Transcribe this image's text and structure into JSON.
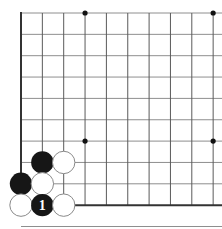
{
  "figure": {
    "kind": "go-board-diagram",
    "background_color": "#ffffff"
  },
  "board": {
    "origin_x": 21,
    "origin_y": 13,
    "spacing": 21.35,
    "cols_visible": 10,
    "rows_visible": 10,
    "grid_color_vertical": "#5a5a5a",
    "grid_color_horizontal": "#8e8e8e",
    "edge_color": "#333333",
    "edge_width": 2.0,
    "grid_width": 1.0,
    "left_edge_col": 0,
    "bottom_edge_row": 9,
    "star_point_color": "#111111",
    "star_point_radius": 2.6,
    "star_points": [
      {
        "col": 3,
        "row": 0,
        "name": "star-point-top-left"
      },
      {
        "col": 9,
        "row": 0,
        "name": "star-point-top-right"
      },
      {
        "col": 3,
        "row": 6,
        "name": "star-point-bottom-left"
      },
      {
        "col": 9,
        "row": 6,
        "name": "star-point-bottom-right"
      }
    ],
    "star_point_rows_note": "lower star points sit on the 7th visible horizontal line"
  },
  "stones": {
    "radius": 11.2,
    "black_fill": "#161616",
    "white_fill": "#ffffff",
    "white_outline": "#8a8a8a",
    "white_outline_width": 1.0,
    "label_color": "#ffffff",
    "label_font_size": 14,
    "items": [
      {
        "color": "black",
        "col": 1,
        "row": 7,
        "label": "",
        "name": "black-stone-1"
      },
      {
        "color": "white",
        "col": 2,
        "row": 7,
        "label": "",
        "name": "white-stone-1"
      },
      {
        "color": "black",
        "col": 0,
        "row": 8,
        "label": "",
        "name": "black-stone-2"
      },
      {
        "color": "white",
        "col": 1,
        "row": 8,
        "label": "",
        "name": "white-stone-2"
      },
      {
        "color": "white",
        "col": 0,
        "row": 9,
        "label": "",
        "name": "white-stone-3"
      },
      {
        "color": "black",
        "col": 1,
        "row": 9,
        "label": "1",
        "name": "black-stone-move-1"
      },
      {
        "color": "white",
        "col": 2,
        "row": 9,
        "label": "",
        "name": "white-stone-4"
      }
    ]
  },
  "legend": {
    "move_number": "1",
    "move_color": "black"
  }
}
